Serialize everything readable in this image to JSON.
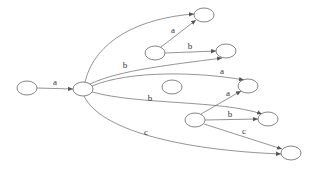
{
  "diagram": {
    "type": "state-machine",
    "nodes": [
      {
        "id": "n0",
        "cx": 27,
        "cy": 88,
        "rx": 10,
        "ry": 7
      },
      {
        "id": "n1",
        "cx": 83,
        "cy": 89,
        "rx": 10,
        "ry": 7
      },
      {
        "id": "n2",
        "cx": 204,
        "cy": 15,
        "rx": 10,
        "ry": 7
      },
      {
        "id": "n3",
        "cx": 155,
        "cy": 53,
        "rx": 10,
        "ry": 7
      },
      {
        "id": "n4",
        "cx": 226,
        "cy": 51,
        "rx": 10,
        "ry": 7
      },
      {
        "id": "n5",
        "cx": 172,
        "cy": 87,
        "rx": 10,
        "ry": 7
      },
      {
        "id": "n6",
        "cx": 248,
        "cy": 86,
        "rx": 10,
        "ry": 7
      },
      {
        "id": "n7",
        "cx": 195,
        "cy": 120,
        "rx": 10,
        "ry": 7
      },
      {
        "id": "n8",
        "cx": 268,
        "cy": 119,
        "rx": 10,
        "ry": 7
      },
      {
        "id": "n9",
        "cx": 291,
        "cy": 153,
        "rx": 10,
        "ry": 7
      }
    ],
    "edges": [
      {
        "from": "n0",
        "to": "n1",
        "label": "a",
        "path": "M37,88 L73,89",
        "lx": 55,
        "ly": 85
      },
      {
        "from": "n1",
        "to": "n2",
        "label": "",
        "path": "M85,82 C95,40 140,18 194,14",
        "lx": 0,
        "ly": 0
      },
      {
        "from": "n1",
        "to": "n4",
        "label": "b",
        "path": "M90,84 C120,70 170,65 222,58",
        "lx": 125,
        "ly": 68
      },
      {
        "from": "n1",
        "to": "n6",
        "label": "a",
        "path": "M92,86 C130,70 200,72 244,80",
        "lx": 222,
        "ly": 74
      },
      {
        "from": "n1",
        "to": "n8",
        "label": "b",
        "path": "M92,92 C140,105 220,100 262,114",
        "lx": 150,
        "ly": 101
      },
      {
        "from": "n1",
        "to": "n9",
        "label": "c",
        "path": "M84,96 C100,130 180,150 281,154",
        "lx": 146,
        "ly": 135
      },
      {
        "from": "n3",
        "to": "n2",
        "label": "a",
        "path": "M161,47 L196,20",
        "lx": 173,
        "ly": 33
      },
      {
        "from": "n3",
        "to": "n4",
        "label": "b",
        "path": "M165,53 L216,51",
        "lx": 190,
        "ly": 49
      },
      {
        "from": "n7",
        "to": "n6",
        "label": "a",
        "path": "M201,114 L241,91",
        "lx": 228,
        "ly": 96
      },
      {
        "from": "n7",
        "to": "n8",
        "label": "b",
        "path": "M205,120 L258,119",
        "lx": 230,
        "ly": 117
      },
      {
        "from": "n7",
        "to": "n9",
        "label": "c",
        "path": "M204,124 L282,149",
        "lx": 244,
        "ly": 134
      }
    ]
  }
}
